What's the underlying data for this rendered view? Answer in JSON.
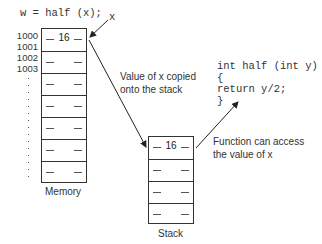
{
  "call_statement": "w = half (x);",
  "call_var_label": "x",
  "memory": {
    "label": "Memory",
    "addresses": [
      "1000",
      "1001",
      "1002",
      "1003"
    ],
    "cells": [
      "16",
      "",
      "",
      "",
      "",
      "",
      "",
      ""
    ]
  },
  "annotation_copy": {
    "line1": "Value of x copied",
    "line2": "onto the stack"
  },
  "function_code": {
    "line1": "int half (int y)",
    "line2": "{",
    "line3": "return y/2;",
    "line4": "}"
  },
  "annotation_access": {
    "line1": "Function can access",
    "line2": "the value of x"
  },
  "stack": {
    "label": "Stack",
    "cells": [
      "16",
      "",
      "",
      ""
    ]
  },
  "colors": {
    "line": "#333333",
    "text": "#222222",
    "background": "#ffffff"
  }
}
